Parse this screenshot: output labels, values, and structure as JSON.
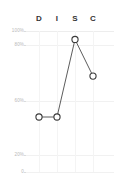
{
  "chart_data": {
    "type": "line",
    "title": "",
    "subtitle": "",
    "xlabel": "",
    "ylabel": "",
    "categories": [
      "D",
      "I",
      "S",
      "C"
    ],
    "values": [
      39,
      39,
      94,
      68
    ],
    "series": [
      {
        "name": "DISC profile",
        "values": [
          39,
          39,
          94,
          68
        ]
      }
    ],
    "ylim": [
      0,
      100
    ],
    "ytick_labels": [
      "100%",
      "80%",
      "60%",
      "20%",
      "0"
    ],
    "ytick_values": [
      100,
      80,
      60,
      20,
      0
    ],
    "grid": true,
    "legend": "none",
    "marker": "circle-open",
    "line_color": "#4a4a4a",
    "marker_color": "#3a3a3a",
    "marker_fill": "#ffffff",
    "grid_color": "#f1f1f1",
    "tick_label_color": "#b9b9b9",
    "header_label_color": "#333333"
  },
  "axis": {
    "y_ticks": [
      {
        "label": "100%",
        "value": 100
      },
      {
        "label": "80%",
        "value": 80
      },
      {
        "label": "60%",
        "value": 60
      },
      {
        "label": "20%",
        "value": 20
      },
      {
        "label": "0",
        "value": 0
      }
    ],
    "x_ticks": [
      {
        "label": "D"
      },
      {
        "label": "I"
      },
      {
        "label": "S"
      },
      {
        "label": "C"
      }
    ]
  }
}
